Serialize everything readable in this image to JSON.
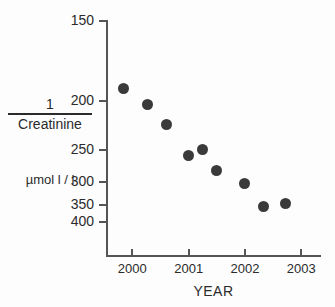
{
  "chart_data": {
    "type": "scatter",
    "title": "",
    "xlabel": "YEAR",
    "ylabel": "1 / Creatinine",
    "ylabel_numerator": "1",
    "ylabel_denominator": "Creatinine",
    "yunits": "µmol l / l",
    "y_scale": "reciprocal-inverted",
    "ylim": [
      150,
      400
    ],
    "xlim": [
      1999.55,
      2003.35
    ],
    "grid": false,
    "legend": null,
    "marker_color": "#3a3a3a",
    "axis_color": "#555555",
    "background_color": "#fdfdfd",
    "ytick_labels": [
      "150",
      "200",
      "250",
      "300",
      "350",
      "400"
    ],
    "ytick_values": [
      150,
      200,
      250,
      300,
      350,
      400
    ],
    "xtick_labels": [
      "2000",
      "2001",
      "2002",
      "2003"
    ],
    "xtick_values": [
      2000,
      2001,
      2002,
      2003
    ],
    "x": [
      1999.85,
      2000.27,
      2000.6,
      2001.0,
      2001.25,
      2001.5,
      2002.0,
      2002.33,
      2002.72
    ],
    "values": [
      190,
      203,
      221,
      258,
      250,
      281,
      303,
      354,
      348
    ],
    "series": [
      {
        "name": "Creatinine",
        "points": [
          {
            "x": 1999.85,
            "y": 190
          },
          {
            "x": 2000.27,
            "y": 203
          },
          {
            "x": 2000.6,
            "y": 221
          },
          {
            "x": 2001.0,
            "y": 258
          },
          {
            "x": 2001.25,
            "y": 250
          },
          {
            "x": 2001.5,
            "y": 281
          },
          {
            "x": 2002.0,
            "y": 303
          },
          {
            "x": 2002.33,
            "y": 354
          },
          {
            "x": 2002.72,
            "y": 348
          }
        ]
      }
    ]
  }
}
